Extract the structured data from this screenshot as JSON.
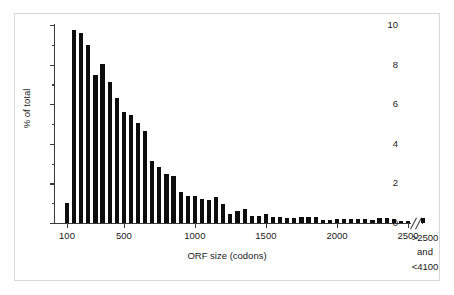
{
  "chart_data": {
    "type": "bar",
    "title": "",
    "xlabel": "ORF size (codons)",
    "ylabel": "% of total",
    "ylim": [
      0,
      10
    ],
    "xlim": [
      75,
      2550
    ],
    "grid": false,
    "legend": null,
    "y_ticks_major": [
      "0",
      "2",
      "4",
      "6",
      "8",
      "10"
    ],
    "y_tick_values_major": [
      0,
      2,
      4,
      6,
      8,
      10
    ],
    "y_tick_values_minor": [
      1,
      3,
      5,
      7,
      9
    ],
    "x_ticks": [
      "100",
      "500",
      "1000",
      "1500",
      "2000",
      "2500"
    ],
    "x_tick_values": [
      100,
      500,
      1000,
      1500,
      2000,
      2500
    ],
    "axis_break": true,
    "axis_break_note": "x-axis broken between 2500 and the final >2500 category",
    "last_category_label": [
      ">2500",
      "and",
      "<4100"
    ],
    "bar_color": "#0d0d0d",
    "bin_width_codons": 50,
    "x": [
      100,
      150,
      200,
      250,
      300,
      350,
      400,
      450,
      500,
      550,
      600,
      650,
      700,
      750,
      800,
      850,
      900,
      950,
      1000,
      1050,
      1100,
      1150,
      1200,
      1250,
      1300,
      1350,
      1400,
      1450,
      1500,
      1550,
      1600,
      1650,
      1700,
      1750,
      1800,
      1850,
      1900,
      1950,
      2000,
      2050,
      2100,
      2150,
      2200,
      2250,
      2300,
      2350,
      2400,
      2450,
      2500
    ],
    "values": [
      1.0,
      9.75,
      9.6,
      9.0,
      7.5,
      8.05,
      7.1,
      6.3,
      5.6,
      5.45,
      5.05,
      4.65,
      3.15,
      2.85,
      2.45,
      2.35,
      1.55,
      1.35,
      1.35,
      1.2,
      1.15,
      1.3,
      0.95,
      0.45,
      0.6,
      0.7,
      0.35,
      0.35,
      0.45,
      0.3,
      0.3,
      0.25,
      0.25,
      0.3,
      0.3,
      0.3,
      0.15,
      0.15,
      0.2,
      0.2,
      0.2,
      0.2,
      0.2,
      0.15,
      0.25,
      0.25,
      0.2,
      0.1,
      0.1
    ],
    "overflow_bar": {
      "label": ">2500 and <4100",
      "value": 0.25
    }
  },
  "figure": {
    "ytitle": "% of total",
    "xtitle": "ORF size (codons)"
  }
}
